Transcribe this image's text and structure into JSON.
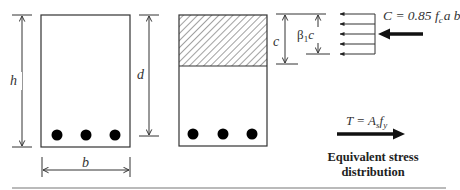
{
  "figure": {
    "sections": {
      "beam_section": {
        "height_label": "h",
        "effective_depth_label": "d",
        "width_label": "b",
        "rebar_count": 3
      },
      "stress_block": {
        "effective_depth_label": "d",
        "neutral_axis_label": "c",
        "block_depth_label_beta": "β",
        "block_depth_label_sub": "1",
        "block_depth_label_c": "c",
        "rebar_count": 3
      }
    },
    "forces": {
      "compression": {
        "label_prefix": "C = 0.85 ",
        "fc": "f",
        "fc_sub": "c",
        "suffix": "a b"
      },
      "tension": {
        "label_prefix": "T = ",
        "as": "A",
        "as_sub": "s",
        "fy": "f",
        "fy_sub": "y"
      }
    },
    "caption": {
      "line1": "Equivalent stress",
      "line2": "distribution"
    },
    "colors": {
      "stroke": "#333333",
      "fill_rebar": "#000000",
      "rule": "#777777"
    }
  }
}
